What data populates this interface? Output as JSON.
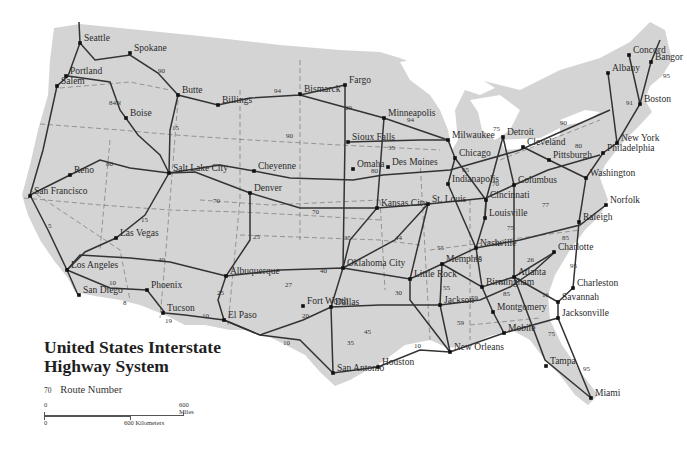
{
  "title": {
    "line1": "United States Interstate",
    "line2": "Highway System"
  },
  "legend": {
    "route_sample": "70",
    "route_label": "Route Number"
  },
  "scale": {
    "miles_start": "0",
    "miles_end": "600 Miles",
    "km_start": "0",
    "km_end": "600 Kilometers"
  },
  "colors": {
    "land": "#d4d4d4",
    "water": "#ffffff",
    "highway": "#3a3a3a",
    "border": "#555555"
  },
  "cities": [
    {
      "name": "Seattle",
      "x": 80,
      "y": 43
    },
    {
      "name": "Spokane",
      "x": 130,
      "y": 53
    },
    {
      "name": "Portland",
      "x": 66,
      "y": 76
    },
    {
      "name": "Salem",
      "x": 57,
      "y": 86
    },
    {
      "name": "Butte",
      "x": 178,
      "y": 95
    },
    {
      "name": "Billings",
      "x": 218,
      "y": 105
    },
    {
      "name": "Boise",
      "x": 126,
      "y": 118
    },
    {
      "name": "Fargo",
      "x": 345,
      "y": 85
    },
    {
      "name": "Bismarck",
      "x": 300,
      "y": 94
    },
    {
      "name": "Minneapolis",
      "x": 384,
      "y": 118
    },
    {
      "name": "Sioux Falls",
      "x": 348,
      "y": 142
    },
    {
      "name": "Milwaukee",
      "x": 448,
      "y": 140
    },
    {
      "name": "Chicago",
      "x": 455,
      "y": 158
    },
    {
      "name": "Detroit",
      "x": 503,
      "y": 137
    },
    {
      "name": "Cleveland",
      "x": 523,
      "y": 147
    },
    {
      "name": "Pittsburgh",
      "x": 549,
      "y": 160
    },
    {
      "name": "Albany",
      "x": 608,
      "y": 73
    },
    {
      "name": "Concord",
      "x": 629,
      "y": 55
    },
    {
      "name": "Boston",
      "x": 640,
      "y": 104
    },
    {
      "name": "Bangor",
      "x": 651,
      "y": 62
    },
    {
      "name": "New York",
      "x": 617,
      "y": 143
    },
    {
      "name": "Philadelphia",
      "x": 603,
      "y": 153
    },
    {
      "name": "Washington",
      "x": 586,
      "y": 178
    },
    {
      "name": "Norfolk",
      "x": 606,
      "y": 205
    },
    {
      "name": "Reno",
      "x": 70,
      "y": 175
    },
    {
      "name": "San Francisco",
      "x": 30,
      "y": 196
    },
    {
      "name": "Salt Lake City",
      "x": 169,
      "y": 173
    },
    {
      "name": "Cheyenne",
      "x": 254,
      "y": 171
    },
    {
      "name": "Denver",
      "x": 250,
      "y": 193
    },
    {
      "name": "Omaha",
      "x": 353,
      "y": 169
    },
    {
      "name": "Des Moines",
      "x": 388,
      "y": 167
    },
    {
      "name": "Kansas City",
      "x": 377,
      "y": 208
    },
    {
      "name": "St. Louis",
      "x": 428,
      "y": 204
    },
    {
      "name": "Indianapolis",
      "x": 448,
      "y": 184
    },
    {
      "name": "Cincinnati",
      "x": 486,
      "y": 200
    },
    {
      "name": "Columbus",
      "x": 514,
      "y": 185
    },
    {
      "name": "Louisville",
      "x": 485,
      "y": 218
    },
    {
      "name": "Las Vegas",
      "x": 116,
      "y": 238
    },
    {
      "name": "Los Angeles",
      "x": 67,
      "y": 270
    },
    {
      "name": "San Diego",
      "x": 79,
      "y": 295
    },
    {
      "name": "Phoenix",
      "x": 147,
      "y": 290
    },
    {
      "name": "Tucson",
      "x": 163,
      "y": 313
    },
    {
      "name": "Albuquerque",
      "x": 226,
      "y": 276
    },
    {
      "name": "El Paso",
      "x": 224,
      "y": 320
    },
    {
      "name": "Oklahoma City",
      "x": 343,
      "y": 268
    },
    {
      "name": "Little Rock",
      "x": 410,
      "y": 279
    },
    {
      "name": "Memphis",
      "x": 442,
      "y": 264
    },
    {
      "name": "Nashville",
      "x": 476,
      "y": 248
    },
    {
      "name": "Raleigh",
      "x": 579,
      "y": 222
    },
    {
      "name": "Charlotte",
      "x": 554,
      "y": 252
    },
    {
      "name": "Atlanta",
      "x": 514,
      "y": 277
    },
    {
      "name": "Birmingham",
      "x": 482,
      "y": 287
    },
    {
      "name": "Charleston",
      "x": 573,
      "y": 288
    },
    {
      "name": "Savannah",
      "x": 558,
      "y": 302
    },
    {
      "name": "Montgomery",
      "x": 493,
      "y": 312
    },
    {
      "name": "Jacksonville",
      "x": 558,
      "y": 318
    },
    {
      "name": "Fort Worth",
      "x": 303,
      "y": 306
    },
    {
      "name": "Dallas",
      "x": 331,
      "y": 307
    },
    {
      "name": "Jackson",
      "x": 440,
      "y": 305
    },
    {
      "name": "Mobile",
      "x": 504,
      "y": 333
    },
    {
      "name": "New Orleans",
      "x": 450,
      "y": 352
    },
    {
      "name": "San Antonio",
      "x": 333,
      "y": 373
    },
    {
      "name": "Houston",
      "x": 378,
      "y": 367
    },
    {
      "name": "Tampa",
      "x": 546,
      "y": 366
    },
    {
      "name": "Miami",
      "x": 591,
      "y": 398
    }
  ],
  "routes": [
    {
      "num": "90",
      "x": 158,
      "y": 73
    },
    {
      "name": "84N",
      "num": "84N",
      "x": 109,
      "y": 105
    },
    {
      "num": "15",
      "x": 172,
      "y": 130
    },
    {
      "num": "94",
      "x": 274,
      "y": 93
    },
    {
      "num": "90",
      "x": 286,
      "y": 138
    },
    {
      "num": "94",
      "x": 407,
      "y": 122
    },
    {
      "num": "35",
      "x": 388,
      "y": 150
    },
    {
      "num": "29",
      "x": 345,
      "y": 110
    },
    {
      "num": "80",
      "x": 106,
      "y": 166
    },
    {
      "num": "70",
      "x": 213,
      "y": 203
    },
    {
      "num": "70",
      "x": 312,
      "y": 214
    },
    {
      "num": "80",
      "x": 371,
      "y": 173
    },
    {
      "num": "90",
      "x": 560,
      "y": 125
    },
    {
      "num": "80",
      "x": 575,
      "y": 148
    },
    {
      "num": "95",
      "x": 663,
      "y": 78
    },
    {
      "num": "91",
      "x": 626,
      "y": 105
    },
    {
      "num": "75",
      "x": 493,
      "y": 131
    },
    {
      "num": "65",
      "x": 462,
      "y": 172
    },
    {
      "num": "70",
      "x": 492,
      "y": 186
    },
    {
      "num": "15",
      "x": 141,
      "y": 222
    },
    {
      "num": "5",
      "x": 48,
      "y": 228
    },
    {
      "num": "40",
      "x": 158,
      "y": 262
    },
    {
      "name": "10a",
      "num": "10",
      "x": 109,
      "y": 285
    },
    {
      "num": "8",
      "x": 123,
      "y": 305
    },
    {
      "num": "19",
      "x": 165,
      "y": 323
    },
    {
      "num": "10",
      "x": 202,
      "y": 318
    },
    {
      "num": "25",
      "x": 253,
      "y": 239
    },
    {
      "num": "25",
      "x": 217,
      "y": 295
    },
    {
      "num": "27",
      "x": 285,
      "y": 287
    },
    {
      "num": "35",
      "x": 344,
      "y": 240
    },
    {
      "num": "40",
      "x": 320,
      "y": 273
    },
    {
      "num": "44",
      "x": 395,
      "y": 240
    },
    {
      "num": "20",
      "x": 302,
      "y": 318
    },
    {
      "num": "30",
      "x": 395,
      "y": 295
    },
    {
      "num": "55",
      "x": 437,
      "y": 250
    },
    {
      "num": "10",
      "x": 283,
      "y": 345
    },
    {
      "num": "35",
      "x": 347,
      "y": 345
    },
    {
      "num": "45",
      "x": 364,
      "y": 334
    },
    {
      "num": "10",
      "x": 414,
      "y": 348
    },
    {
      "num": "59",
      "x": 457,
      "y": 325
    },
    {
      "num": "65",
      "x": 475,
      "y": 260
    },
    {
      "num": "40",
      "x": 494,
      "y": 246
    },
    {
      "num": "75",
      "x": 507,
      "y": 230
    },
    {
      "num": "77",
      "x": 542,
      "y": 207
    },
    {
      "num": "85",
      "x": 562,
      "y": 240
    },
    {
      "num": "26",
      "x": 527,
      "y": 262
    },
    {
      "num": "95",
      "x": 570,
      "y": 268
    },
    {
      "num": "59",
      "x": 471,
      "y": 300
    },
    {
      "num": "20",
      "x": 498,
      "y": 284
    },
    {
      "num": "85",
      "x": 503,
      "y": 296
    },
    {
      "num": "16",
      "x": 542,
      "y": 297
    },
    {
      "num": "55",
      "x": 443,
      "y": 290
    },
    {
      "num": "75",
      "x": 548,
      "y": 336
    },
    {
      "num": "95",
      "x": 583,
      "y": 371
    }
  ]
}
